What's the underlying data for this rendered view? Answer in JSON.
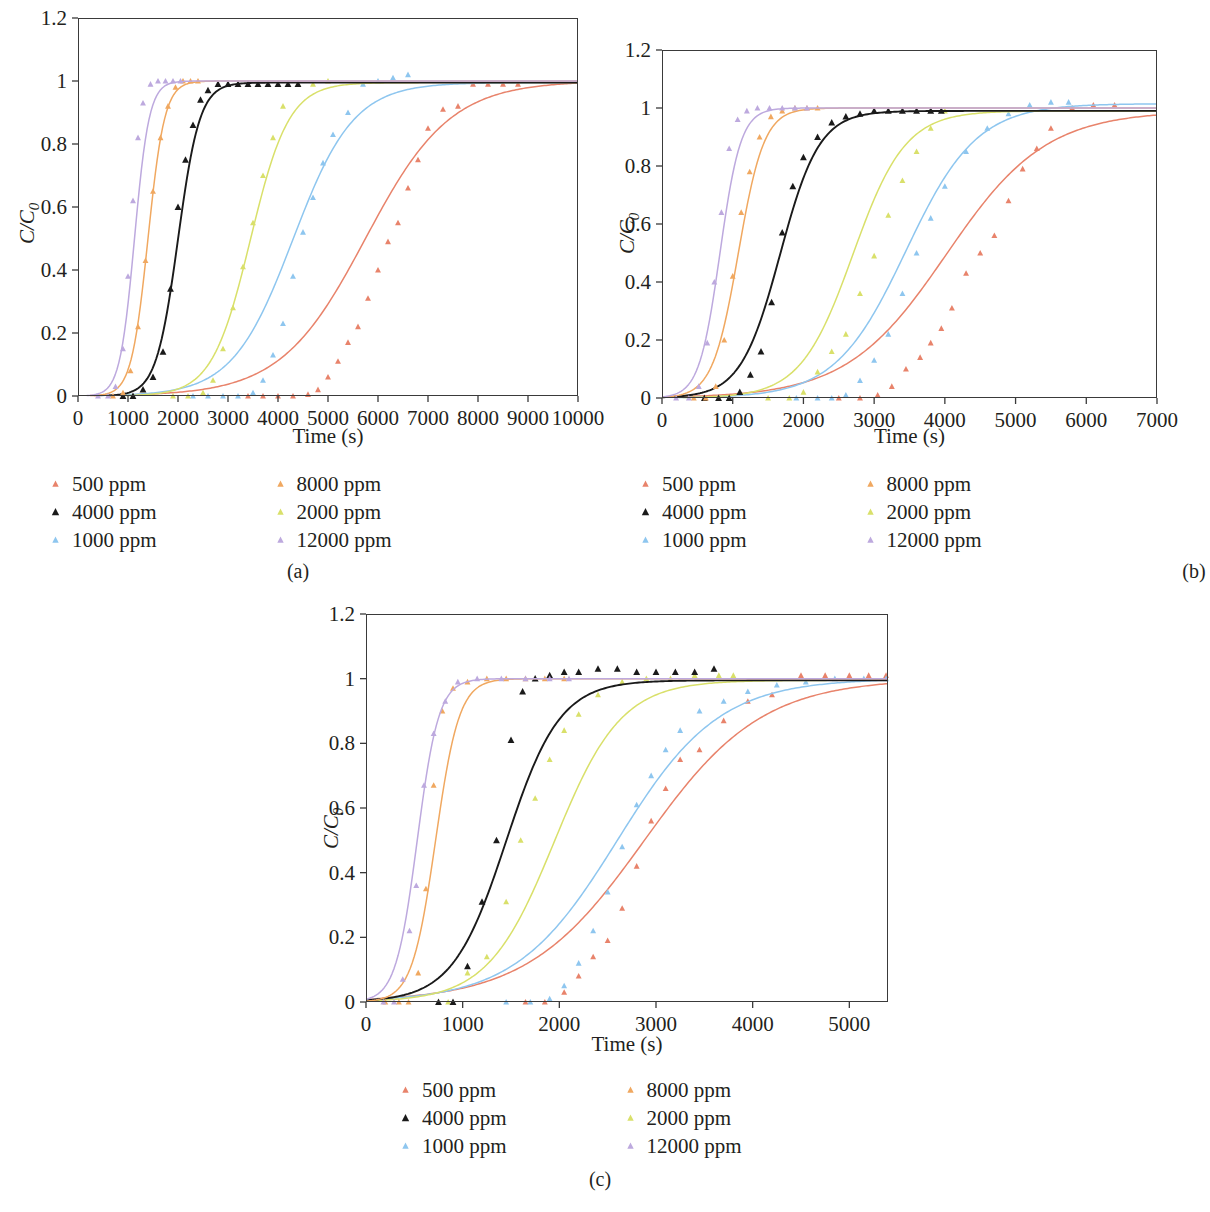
{
  "figure": {
    "series_colors": {
      "500": "#e8836b",
      "1000": "#8ec6ef",
      "2000": "#d9e06a",
      "4000": "#1a1a1a",
      "8000": "#f0a860",
      "12000": "#bda9de"
    },
    "legend_order": [
      "500 ppm",
      "4000 ppm",
      "1000 ppm",
      "8000 ppm",
      "2000 ppm",
      "12000 ppm"
    ],
    "legend_left": [
      "500 ppm",
      "4000 ppm",
      "1000 ppm"
    ],
    "legend_right": [
      "8000 ppm",
      "2000 ppm",
      "12000 ppm"
    ],
    "ylabel_num": "C",
    "ylabel_den": "C",
    "ylabel_sub": "0",
    "xlabel": "Time (s)",
    "captions": {
      "a": "(a)",
      "b": "(b)",
      "c": "(c)"
    }
  },
  "chart_data": [
    {
      "panel": "a",
      "type": "line",
      "title": "",
      "xlabel": "Time (s)",
      "ylabel": "C/C0",
      "xlim": [
        0,
        10000
      ],
      "ylim": [
        0,
        1.2
      ],
      "xticks": [
        0,
        1000,
        2000,
        3000,
        4000,
        5000,
        6000,
        7000,
        8000,
        9000,
        10000
      ],
      "yticks": [
        0,
        0.2,
        0.4,
        0.6,
        0.8,
        1,
        1.2
      ],
      "grid": false,
      "legend_position": "below",
      "series": [
        {
          "name": "500 ppm",
          "color": "#e8836b",
          "fit": {
            "t50": 5750,
            "k": 0.00118,
            "plateau": 1.0
          },
          "points_x": [
            3400,
            3700,
            4000,
            4300,
            4600,
            4800,
            5000,
            5200,
            5400,
            5600,
            5800,
            6000,
            6200,
            6400,
            6600,
            6800,
            7000,
            7300,
            7600,
            7900,
            8200,
            8500,
            8800
          ],
          "points_y": [
            0.0,
            0.0,
            0.0,
            0.0,
            0.005,
            0.02,
            0.06,
            0.11,
            0.17,
            0.22,
            0.31,
            0.4,
            0.49,
            0.55,
            0.66,
            0.75,
            0.85,
            0.91,
            0.92,
            0.99,
            0.99,
            0.99,
            0.99
          ]
        },
        {
          "name": "1000 ppm",
          "color": "#8ec6ef",
          "fit": {
            "t50": 4300,
            "k": 0.00165,
            "plateau": 0.995
          },
          "points_x": [
            2300,
            2600,
            2900,
            3200,
            3500,
            3700,
            3900,
            4100,
            4300,
            4500,
            4700,
            4900,
            5100,
            5400,
            5700,
            6000,
            6300,
            6600
          ],
          "points_y": [
            0.0,
            0.0,
            0.0,
            0.0,
            0.01,
            0.05,
            0.13,
            0.23,
            0.38,
            0.52,
            0.63,
            0.74,
            0.83,
            0.9,
            0.99,
            1.0,
            1.01,
            1.02
          ]
        },
        {
          "name": "2000 ppm",
          "color": "#d9e06a",
          "fit": {
            "t50": 3450,
            "k": 0.0026,
            "plateau": 0.995
          },
          "points_x": [
            1900,
            2200,
            2500,
            2700,
            2900,
            3100,
            3300,
            3500,
            3700,
            3900,
            4100,
            4400,
            4700,
            5000
          ],
          "points_y": [
            0.0,
            0.0,
            0.01,
            0.05,
            0.15,
            0.28,
            0.41,
            0.55,
            0.7,
            0.82,
            0.92,
            0.99,
            0.99,
            1.0
          ]
        },
        {
          "name": "4000 ppm",
          "color": "#1a1a1a",
          "fit": {
            "t50": 2000,
            "k": 0.0046,
            "plateau": 0.995
          },
          "points_x": [
            900,
            1100,
            1300,
            1500,
            1700,
            1850,
            2000,
            2150,
            2300,
            2450,
            2600,
            2800,
            3000,
            3200,
            3400,
            3600,
            3800,
            4000,
            4200,
            4400
          ],
          "points_y": [
            0.0,
            0.0,
            0.02,
            0.06,
            0.14,
            0.34,
            0.6,
            0.75,
            0.86,
            0.94,
            0.97,
            0.99,
            0.99,
            0.99,
            0.99,
            0.99,
            0.99,
            0.99,
            0.99,
            0.99
          ]
        },
        {
          "name": "8000 ppm",
          "color": "#f0a860",
          "fit": {
            "t50": 1400,
            "k": 0.006,
            "plateau": 1.0
          },
          "points_x": [
            700,
            900,
            1050,
            1200,
            1350,
            1500,
            1650,
            1800,
            1950,
            2100,
            2250,
            2400
          ],
          "points_y": [
            0.0,
            0.01,
            0.08,
            0.22,
            0.43,
            0.65,
            0.82,
            0.92,
            0.98,
            1.0,
            1.0,
            1.0
          ]
        },
        {
          "name": "12000 ppm",
          "color": "#bda9de",
          "fit": {
            "t50": 1130,
            "k": 0.0068,
            "plateau": 1.0
          },
          "points_x": [
            400,
            600,
            750,
            900,
            1000,
            1100,
            1200,
            1300,
            1450,
            1600,
            1750,
            1900,
            2050
          ],
          "points_y": [
            0.0,
            0.0,
            0.03,
            0.15,
            0.38,
            0.62,
            0.82,
            0.93,
            0.99,
            1.0,
            1.0,
            1.0,
            1.0
          ]
        }
      ]
    },
    {
      "panel": "b",
      "type": "line",
      "title": "",
      "xlabel": "Time (s)",
      "ylabel": "C/C0",
      "xlim": [
        0,
        7000
      ],
      "ylim": [
        0,
        1.2
      ],
      "xticks": [
        0,
        1000,
        2000,
        3000,
        4000,
        5000,
        6000,
        7000
      ],
      "yticks": [
        0,
        0.2,
        0.4,
        0.6,
        0.8,
        1,
        1.2
      ],
      "grid": false,
      "legend_position": "below",
      "series": [
        {
          "name": "500 ppm",
          "color": "#e8836b",
          "fit": {
            "t50": 4020,
            "k": 0.00142,
            "plateau": 0.99
          },
          "points_x": [
            2500,
            2800,
            3050,
            3250,
            3450,
            3650,
            3800,
            3950,
            4100,
            4300,
            4500,
            4700,
            4900,
            5100,
            5300,
            5500,
            5800,
            6100,
            6400
          ],
          "points_y": [
            0.0,
            0.0,
            0.01,
            0.04,
            0.1,
            0.14,
            0.19,
            0.24,
            0.31,
            0.43,
            0.5,
            0.56,
            0.68,
            0.79,
            0.86,
            0.93,
            1.0,
            1.01,
            1.01
          ]
        },
        {
          "name": "1000 ppm",
          "color": "#8ec6ef",
          "fit": {
            "t50": 3450,
            "k": 0.002,
            "plateau": 1.015
          },
          "points_x": [
            1900,
            2200,
            2400,
            2600,
            2800,
            3000,
            3200,
            3400,
            3600,
            3800,
            4000,
            4300,
            4600,
            4900,
            5200,
            5500,
            5750
          ],
          "points_y": [
            0.0,
            0.0,
            0.0,
            0.01,
            0.06,
            0.13,
            0.22,
            0.36,
            0.5,
            0.62,
            0.73,
            0.85,
            0.93,
            0.98,
            1.01,
            1.02,
            1.02
          ]
        },
        {
          "name": "2000 ppm",
          "color": "#d9e06a",
          "fit": {
            "t50": 2700,
            "k": 0.0027,
            "plateau": 0.99
          },
          "points_x": [
            1500,
            1800,
            2000,
            2200,
            2400,
            2600,
            2800,
            3000,
            3200,
            3400,
            3600,
            3800,
            4000
          ],
          "points_y": [
            0.0,
            0.0,
            0.02,
            0.09,
            0.16,
            0.22,
            0.36,
            0.49,
            0.63,
            0.75,
            0.85,
            0.93,
            0.99
          ]
        },
        {
          "name": "4000 ppm",
          "color": "#1a1a1a",
          "fit": {
            "t50": 1670,
            "k": 0.0036,
            "plateau": 0.99
          },
          "points_x": [
            600,
            800,
            950,
            1100,
            1250,
            1400,
            1550,
            1700,
            1850,
            2000,
            2200,
            2400,
            2600,
            2800,
            3000,
            3200,
            3400,
            3600,
            3800,
            3950
          ],
          "points_y": [
            0.0,
            0.0,
            0.0,
            0.02,
            0.08,
            0.16,
            0.33,
            0.57,
            0.73,
            0.83,
            0.9,
            0.95,
            0.97,
            0.98,
            0.99,
            0.99,
            0.99,
            0.99,
            0.99,
            0.99
          ]
        },
        {
          "name": "8000 ppm",
          "color": "#f0a860",
          "fit": {
            "t50": 1080,
            "k": 0.0055,
            "plateau": 1.0
          },
          "points_x": [
            450,
            620,
            760,
            880,
            1000,
            1120,
            1240,
            1380,
            1540,
            1700,
            1880,
            2050,
            2200
          ],
          "points_y": [
            0.0,
            0.0,
            0.04,
            0.2,
            0.42,
            0.64,
            0.78,
            0.9,
            0.97,
            0.99,
            1.0,
            1.0,
            1.0
          ]
        },
        {
          "name": "12000 ppm",
          "color": "#bda9de",
          "fit": {
            "t50": 820,
            "k": 0.0068,
            "plateau": 1.0
          },
          "points_x": [
            200,
            380,
            520,
            640,
            740,
            840,
            950,
            1070,
            1200,
            1350,
            1520,
            1700,
            1880,
            2050
          ],
          "points_y": [
            0.0,
            0.0,
            0.04,
            0.19,
            0.4,
            0.64,
            0.86,
            0.96,
            0.99,
            1.0,
            1.0,
            1.0,
            1.0,
            1.0
          ]
        }
      ]
    },
    {
      "panel": "c",
      "type": "line",
      "title": "",
      "xlabel": "Time (s)",
      "ylabel": "C/C0",
      "xlim": [
        0,
        5400
      ],
      "ylim": [
        0,
        1.2
      ],
      "xticks": [
        0,
        1000,
        2000,
        3000,
        4000,
        5000
      ],
      "yticks": [
        0,
        0.2,
        0.4,
        0.6,
        0.8,
        1,
        1.2
      ],
      "grid": false,
      "legend_position": "below",
      "series": [
        {
          "name": "500 ppm",
          "color": "#e8836b",
          "fit": {
            "t50": 2880,
            "k": 0.00165,
            "plateau": 1.0
          },
          "points_x": [
            1650,
            1850,
            2050,
            2200,
            2350,
            2500,
            2650,
            2800,
            2950,
            3100,
            3250,
            3450,
            3700,
            3950,
            4200,
            4500,
            4750,
            5000,
            5200,
            5380
          ],
          "points_y": [
            0.0,
            0.0,
            0.03,
            0.08,
            0.14,
            0.19,
            0.29,
            0.42,
            0.56,
            0.66,
            0.75,
            0.78,
            0.87,
            0.93,
            0.95,
            1.01,
            1.01,
            1.01,
            1.01,
            1.01
          ]
        },
        {
          "name": "1000 ppm",
          "color": "#8ec6ef",
          "fit": {
            "t50": 2600,
            "k": 0.0019,
            "plateau": 1.0
          },
          "points_x": [
            1450,
            1700,
            1900,
            2050,
            2200,
            2350,
            2500,
            2650,
            2800,
            2950,
            3100,
            3250,
            3450,
            3700,
            3950,
            4250,
            4550,
            4850,
            5150,
            5380
          ],
          "points_y": [
            0.0,
            0.0,
            0.01,
            0.05,
            0.12,
            0.22,
            0.34,
            0.48,
            0.61,
            0.7,
            0.78,
            0.84,
            0.9,
            0.93,
            0.96,
            0.98,
            0.99,
            1.0,
            1.0,
            1.0
          ]
        },
        {
          "name": "2000 ppm",
          "color": "#d9e06a",
          "fit": {
            "t50": 1950,
            "k": 0.0029,
            "plateau": 0.995
          },
          "points_x": [
            850,
            1050,
            1250,
            1450,
            1600,
            1750,
            1900,
            2050,
            2200,
            2400,
            2650,
            2900,
            3150,
            3400,
            3650,
            3800
          ],
          "points_y": [
            0.0,
            0.09,
            0.14,
            0.31,
            0.5,
            0.63,
            0.75,
            0.84,
            0.89,
            0.95,
            0.99,
            1.0,
            1.0,
            1.01,
            1.01,
            1.01
          ]
        },
        {
          "name": "4000 ppm",
          "color": "#1a1a1a",
          "fit": {
            "t50": 1450,
            "k": 0.0036,
            "plateau": 0.995
          },
          "points_x": [
            750,
            900,
            1050,
            1200,
            1350,
            1500,
            1620,
            1750,
            1900,
            2050,
            2200,
            2400,
            2600,
            2800,
            3000,
            3200,
            3400,
            3600
          ],
          "points_y": [
            0.0,
            0.0,
            0.11,
            0.31,
            0.5,
            0.81,
            0.96,
            1.0,
            1.01,
            1.02,
            1.02,
            1.03,
            1.03,
            1.02,
            1.02,
            1.02,
            1.02,
            1.03
          ]
        },
        {
          "name": "8000 ppm",
          "color": "#f0a860",
          "fit": {
            "t50": 720,
            "k": 0.0082,
            "plateau": 1.0
          },
          "points_x": [
            200,
            340,
            440,
            540,
            620,
            700,
            790,
            900,
            1050,
            1250,
            1450,
            1650,
            1850,
            2050
          ],
          "points_y": [
            0.0,
            0.0,
            0.0,
            0.09,
            0.35,
            0.67,
            0.9,
            0.97,
            0.99,
            1.0,
            1.0,
            1.0,
            1.0,
            1.0
          ]
        },
        {
          "name": "12000 ppm",
          "color": "#bda9de",
          "fit": {
            "t50": 530,
            "k": 0.009,
            "plateau": 1.0
          },
          "points_x": [
            180,
            290,
            380,
            450,
            520,
            600,
            700,
            820,
            950,
            1150,
            1400,
            1650,
            1900,
            2100
          ],
          "points_y": [
            0.0,
            0.0,
            0.07,
            0.22,
            0.36,
            0.67,
            0.83,
            0.93,
            0.99,
            1.0,
            1.0,
            1.0,
            1.0,
            1.0
          ]
        }
      ]
    }
  ]
}
